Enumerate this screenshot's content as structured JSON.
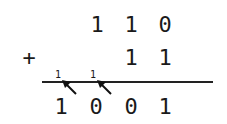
{
  "operation": "binary addition",
  "operator": "+",
  "addend1": [
    "1",
    "1",
    "0"
  ],
  "addend2": [
    "1",
    "1"
  ],
  "carries": [
    "1",
    "1"
  ],
  "result": [
    "1",
    "0",
    "0",
    "1"
  ]
}
